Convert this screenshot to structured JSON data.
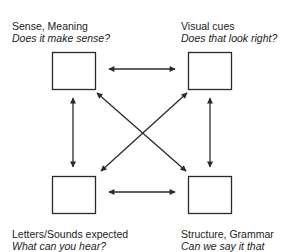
{
  "nodes": [
    {
      "id": "tl",
      "title": "Sense, Meaning",
      "question": "Does it make sense?"
    },
    {
      "id": "tr",
      "title": "Visual cues",
      "question": "Does that look right?"
    },
    {
      "id": "bl",
      "title": "Letters/Sounds expected",
      "question": "What can you hear?"
    },
    {
      "id": "br",
      "title": "Structure, Grammar",
      "question": "Can we say it that"
    }
  ],
  "edges": [
    {
      "from": "tl",
      "to": "tr",
      "type": "bidirectional"
    },
    {
      "from": "bl",
      "to": "br",
      "type": "bidirectional"
    },
    {
      "from": "tl",
      "to": "bl",
      "type": "bidirectional"
    },
    {
      "from": "tr",
      "to": "br",
      "type": "bidirectional"
    },
    {
      "from": "tl",
      "to": "br",
      "type": "bidirectional"
    },
    {
      "from": "tr",
      "to": "bl",
      "type": "bidirectional"
    }
  ],
  "colors": {
    "stroke": "#2a2a2a",
    "background": "#ffffff"
  }
}
